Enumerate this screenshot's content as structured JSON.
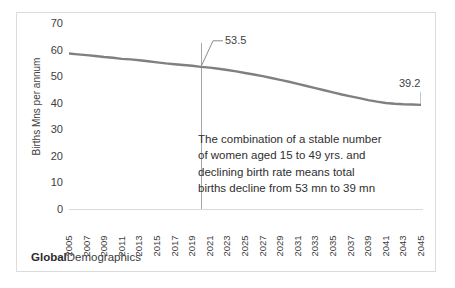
{
  "chart_data": {
    "type": "line",
    "title": "",
    "xlabel": "",
    "ylabel": "Births Mns per annum",
    "ylim": [
      0,
      70
    ],
    "ytick_step": 10,
    "yticks": [
      70,
      60,
      50,
      40,
      30,
      20,
      10,
      0
    ],
    "grid": false,
    "legend": "none",
    "line_color": "#808080",
    "categories": [
      "2005",
      "2006",
      "2007",
      "2008",
      "2009",
      "2010",
      "2011",
      "2012",
      "2013",
      "2014",
      "2015",
      "2016",
      "2017",
      "2018",
      "2019",
      "2020",
      "2021",
      "2022",
      "2023",
      "2024",
      "2025",
      "2026",
      "2027",
      "2028",
      "2029",
      "2030",
      "2031",
      "2032",
      "2033",
      "2034",
      "2035",
      "2036",
      "2037",
      "2038",
      "2039",
      "2040",
      "2041",
      "2042",
      "2043",
      "2044",
      "2045"
    ],
    "xtick_labels": [
      "2005",
      "2007",
      "2009",
      "2011",
      "2013",
      "2015",
      "2017",
      "2019",
      "2021",
      "2023",
      "2025",
      "2027",
      "2029",
      "2031",
      "2033",
      "2035",
      "2037",
      "2039",
      "2041",
      "2043",
      "2045"
    ],
    "series": [
      {
        "name": "Births Mns per annum",
        "values": [
          58.5,
          58.2,
          57.9,
          57.6,
          57.2,
          56.9,
          56.5,
          56.3,
          56.0,
          55.6,
          55.2,
          54.8,
          54.5,
          54.2,
          53.9,
          53.5,
          53.2,
          52.8,
          52.3,
          51.8,
          51.2,
          50.6,
          50.0,
          49.3,
          48.6,
          47.9,
          47.1,
          46.3,
          45.5,
          44.7,
          43.9,
          43.1,
          42.4,
          41.7,
          41.0,
          40.4,
          39.9,
          39.6,
          39.4,
          39.3,
          39.2
        ]
      }
    ],
    "annotations": [
      {
        "label": "53.5",
        "x": "2020",
        "y": 53.5
      },
      {
        "label": "39.2",
        "x": "2045",
        "y": 39.2
      }
    ],
    "marker_line": {
      "x": "2020",
      "color": "#a6a6a6"
    }
  },
  "axis": {
    "y_title": "Births Mns per annum"
  },
  "callouts": {
    "value_2020": "53.5",
    "value_2045": "39.2"
  },
  "annotation": {
    "line1": "The combination of a stable number",
    "line2": "of women aged 15 to 49 yrs. and",
    "line3": "declining birth rate means total",
    "line4": "births decline from 53 mn to 39 mn"
  },
  "footer": {
    "brand_bold": "Global",
    "brand_regular": "Demographics"
  }
}
